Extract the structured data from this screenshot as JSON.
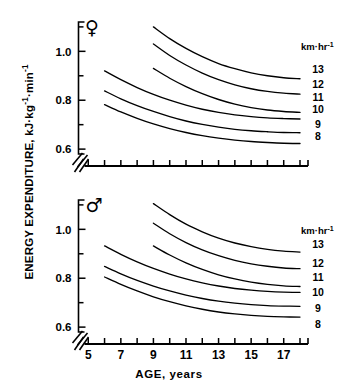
{
  "axis_titles": {
    "y_main": "ENERGY EXPENDITURE, kJ",
    "y_unit1": "kg",
    "y_unit1_sup": "-1",
    "y_unit2": "min",
    "y_unit2_sup": "-1",
    "y_full": "ENERGY EXPENDITURE, kJ·kg⁻¹·min⁻¹",
    "x_full": "AGE, years"
  },
  "legend": {
    "header_text": "km",
    "header_mid": "hr",
    "header_sup": "-1",
    "header_full": "km·hr⁻¹",
    "entries": [
      "13",
      "12",
      "11",
      "10",
      "9",
      "8"
    ]
  },
  "panels": {
    "female": {
      "symbol": "♀",
      "symbol_name": "female-symbol"
    },
    "male": {
      "symbol": "♂",
      "symbol_name": "male-symbol"
    }
  },
  "ticks": {
    "y_labels": [
      "1.0",
      "0.8",
      "0.6"
    ],
    "x_labels": [
      "5",
      "7",
      "9",
      "11",
      "13",
      "15",
      "17"
    ]
  },
  "chart_data": {
    "type": "line",
    "title": "",
    "xlabel": "AGE, years",
    "ylabel": "ENERGY EXPENDITURE, kJ·kg⁻¹·min⁻¹",
    "xlim": [
      4.4,
      18.0
    ],
    "ylim": [
      0.58,
      1.12
    ],
    "x_ticks": [
      5,
      6,
      7,
      8,
      9,
      10,
      11,
      12,
      13,
      14,
      15,
      16,
      17,
      18
    ],
    "x_tick_labels": [
      "5",
      "",
      "7",
      "",
      "9",
      "",
      "11",
      "",
      "13",
      "",
      "15",
      "",
      "17",
      ""
    ],
    "y_ticks": [
      0.6,
      0.7,
      0.8,
      0.9,
      1.0,
      1.1
    ],
    "y_tick_labels": [
      "0.6",
      "",
      "0.8",
      "",
      "1.0",
      ""
    ],
    "grid": false,
    "legend_position": "right",
    "legend_title": "km·hr⁻¹",
    "axis_break": {
      "x": true,
      "y": true,
      "style": "double-slash"
    },
    "panels": [
      {
        "name": "female",
        "symbol": "♀",
        "series": [
          {
            "name": "13",
            "speed_km_hr": 13,
            "x": [
              9,
              10,
              11,
              12,
              13,
              14,
              15,
              16,
              17,
              18
            ],
            "values": [
              1.1,
              1.052,
              1.012,
              0.978,
              0.95,
              0.929,
              0.912,
              0.9,
              0.892,
              0.888
            ]
          },
          {
            "name": "12",
            "speed_km_hr": 12,
            "x": [
              9,
              10,
              11,
              12,
              13,
              14,
              15,
              16,
              17,
              18
            ],
            "values": [
              1.03,
              0.983,
              0.944,
              0.911,
              0.884,
              0.863,
              0.847,
              0.836,
              0.829,
              0.825
            ]
          },
          {
            "name": "11",
            "speed_km_hr": 11,
            "x": [
              9,
              10,
              11,
              12,
              13,
              14,
              15,
              16,
              17,
              18
            ],
            "values": [
              0.93,
              0.89,
              0.856,
              0.827,
              0.803,
              0.784,
              0.77,
              0.76,
              0.754,
              0.75
            ]
          },
          {
            "name": "10",
            "speed_km_hr": 10,
            "x": [
              6,
              7,
              8,
              9,
              10,
              11,
              12,
              13,
              14,
              15,
              16,
              17,
              18
            ],
            "values": [
              0.92,
              0.884,
              0.852,
              0.824,
              0.8,
              0.78,
              0.763,
              0.75,
              0.74,
              0.733,
              0.728,
              0.725,
              0.723
            ]
          },
          {
            "name": "9",
            "speed_km_hr": 9,
            "x": [
              6,
              7,
              8,
              9,
              10,
              11,
              12,
              13,
              14,
              15,
              16,
              17,
              18
            ],
            "values": [
              0.838,
              0.806,
              0.778,
              0.754,
              0.733,
              0.715,
              0.701,
              0.69,
              0.681,
              0.675,
              0.671,
              0.668,
              0.667
            ]
          },
          {
            "name": "8",
            "speed_km_hr": 8,
            "x": [
              6,
              7,
              8,
              9,
              10,
              11,
              12,
              13,
              14,
              15,
              16,
              17,
              18
            ],
            "values": [
              0.782,
              0.752,
              0.726,
              0.703,
              0.684,
              0.668,
              0.655,
              0.645,
              0.637,
              0.631,
              0.627,
              0.624,
              0.623
            ]
          }
        ]
      },
      {
        "name": "male",
        "symbol": "♂",
        "series": [
          {
            "name": "13",
            "speed_km_hr": 13,
            "x": [
              9,
              10,
              11,
              12,
              13,
              14,
              15,
              16,
              17,
              18
            ],
            "values": [
              1.105,
              1.06,
              1.021,
              0.99,
              0.964,
              0.944,
              0.929,
              0.918,
              0.911,
              0.907
            ]
          },
          {
            "name": "12",
            "speed_km_hr": 12,
            "x": [
              9,
              10,
              11,
              12,
              13,
              14,
              15,
              16,
              17,
              18
            ],
            "values": [
              1.025,
              0.982,
              0.946,
              0.916,
              0.892,
              0.873,
              0.859,
              0.849,
              0.842,
              0.839
            ]
          },
          {
            "name": "11",
            "speed_km_hr": 11,
            "x": [
              9,
              10,
              11,
              12,
              13,
              14,
              15,
              16,
              17,
              18
            ],
            "values": [
              0.932,
              0.895,
              0.863,
              0.836,
              0.814,
              0.797,
              0.784,
              0.775,
              0.769,
              0.766
            ]
          },
          {
            "name": "10",
            "speed_km_hr": 10,
            "x": [
              6,
              7,
              8,
              9,
              10,
              11,
              12,
              13,
              14,
              15,
              16,
              17,
              18
            ],
            "values": [
              0.932,
              0.898,
              0.867,
              0.84,
              0.817,
              0.797,
              0.781,
              0.768,
              0.758,
              0.751,
              0.746,
              0.743,
              0.742
            ]
          },
          {
            "name": "9",
            "speed_km_hr": 9,
            "x": [
              6,
              7,
              8,
              9,
              10,
              11,
              12,
              13,
              14,
              15,
              16,
              17,
              18
            ],
            "values": [
              0.848,
              0.818,
              0.791,
              0.768,
              0.748,
              0.731,
              0.717,
              0.706,
              0.698,
              0.692,
              0.688,
              0.686,
              0.685
            ]
          },
          {
            "name": "8",
            "speed_km_hr": 8,
            "x": [
              6,
              7,
              8,
              9,
              10,
              11,
              12,
              13,
              14,
              15,
              16,
              17,
              18
            ],
            "values": [
              0.805,
              0.775,
              0.748,
              0.724,
              0.704,
              0.687,
              0.673,
              0.662,
              0.654,
              0.648,
              0.644,
              0.642,
              0.641
            ]
          }
        ]
      }
    ]
  }
}
